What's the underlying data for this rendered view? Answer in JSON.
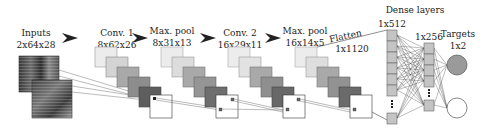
{
  "diagram": {
    "type": "cnn-architecture",
    "layers": [
      {
        "name": "Inputs",
        "shape": "2x64x28"
      },
      {
        "name": "Conv. 1",
        "shape": "8x62x26"
      },
      {
        "name": "Max. pool",
        "shape": "8x31x13"
      },
      {
        "name": "Conv. 2",
        "shape": "16x29x11"
      },
      {
        "name": "Max. pool",
        "shape": "16x14x5"
      },
      {
        "name": "Flatten",
        "shape": "1x1120"
      }
    ],
    "dense": {
      "title": "Dense layers",
      "layer1_shape": "1x512",
      "layer2_shape": "1x256"
    },
    "targets": {
      "title": "Targets",
      "shape": "1x2"
    },
    "colors": {
      "stack": [
        "#e4e4e4",
        "#cfcfcf",
        "#a8a8a8",
        "#8e8e8e",
        "#6a6a6a"
      ],
      "neuron": "#bdbdbd",
      "target_filled": "#9a9a9a",
      "line": "#555555"
    }
  }
}
